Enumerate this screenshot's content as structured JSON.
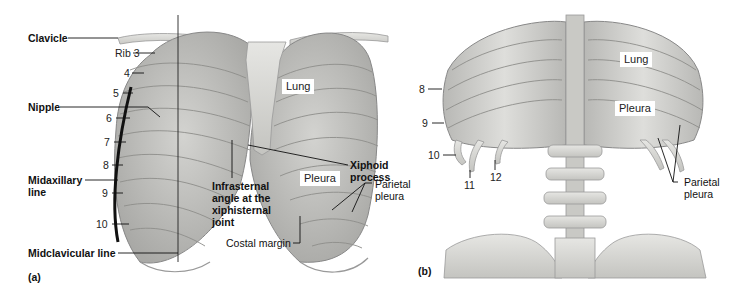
{
  "figure": {
    "panel_a": {
      "panel_label": "(a)",
      "view": "anterior thorax",
      "labels": {
        "clavicle": "Clavicle",
        "rib3": "Rib 3",
        "nipple": "Nipple",
        "midaxillary_line_1": "Midaxillary",
        "midaxillary_line_2": "line",
        "midclavicular_line": "Midclavicular line",
        "lung": "Lung",
        "pleura": "Pleura",
        "xiphoid_1": "Xiphoid",
        "xiphoid_2": "process",
        "infrasternal_1": "Infrasternal",
        "infrasternal_2": "angle at the",
        "infrasternal_3": "xiphisternal",
        "infrasternal_4": "joint",
        "parietal_1": "Parietal",
        "parietal_2": "pleura",
        "costal_margin": "Costal margin"
      },
      "rib_numbers": [
        "4",
        "5",
        "6",
        "7",
        "8",
        "9",
        "10"
      ]
    },
    "panel_b": {
      "panel_label": "(b)",
      "view": "posterior thorax",
      "labels": {
        "lung": "Lung",
        "pleura": "Pleura",
        "parietal_1": "Parietal",
        "parietal_2": "pleura"
      },
      "rib_numbers": [
        "8",
        "9",
        "10",
        "11",
        "12"
      ]
    },
    "colors": {
      "bone": "#d9d9d6",
      "bone_dark": "#a8a8a4",
      "lung_fill": "#bdbdba",
      "line": "#111111"
    }
  }
}
